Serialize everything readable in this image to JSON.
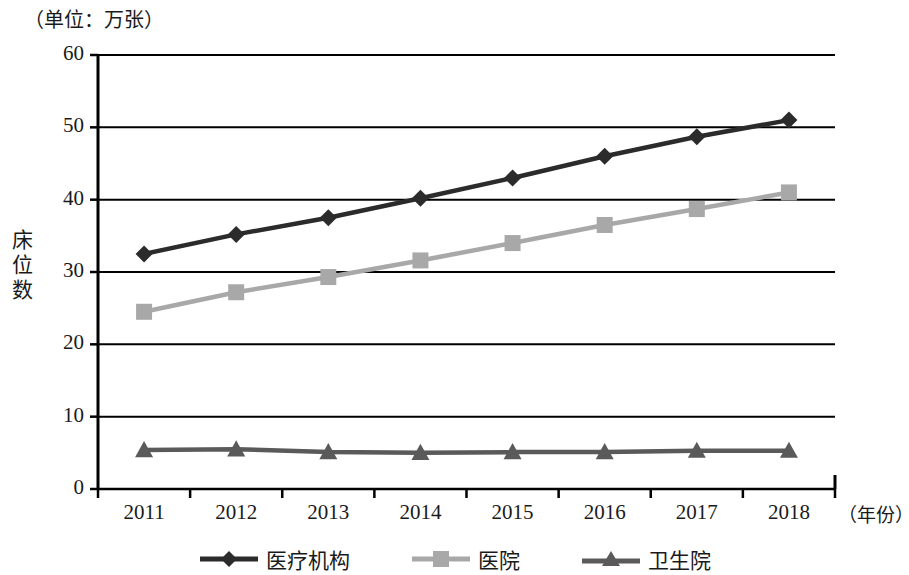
{
  "chart_data": {
    "type": "line",
    "title": "（单位：万张）",
    "unit_note": "（单位：万张）",
    "xlabel": "（年份）",
    "ylabel": "床位数",
    "categories": [
      "2011",
      "2012",
      "2013",
      "2014",
      "2015",
      "2016",
      "2017",
      "2018"
    ],
    "x": [
      2011,
      2012,
      2013,
      2014,
      2015,
      2016,
      2017,
      2018
    ],
    "ylim": [
      0,
      60
    ],
    "yticks": [
      0,
      10,
      20,
      30,
      40,
      50,
      60
    ],
    "ytick_labels": [
      "0",
      "10",
      "20",
      "30",
      "40",
      "50",
      "60"
    ],
    "grid": true,
    "legend_position": "bottom",
    "series": [
      {
        "name": "医疗机构",
        "marker": "diamond",
        "color": "#2b2b2b",
        "values": [
          32.5,
          35.2,
          37.5,
          40.2,
          43.0,
          46.0,
          48.7,
          51.0
        ]
      },
      {
        "name": "医院",
        "marker": "square",
        "color": "#a8a8a8",
        "values": [
          24.5,
          27.2,
          29.3,
          31.6,
          34.0,
          36.5,
          38.7,
          41.0
        ]
      },
      {
        "name": "卫生院",
        "marker": "triangle",
        "color": "#5a5a5a",
        "values": [
          5.4,
          5.5,
          5.1,
          5.0,
          5.1,
          5.1,
          5.3,
          5.3
        ]
      }
    ]
  },
  "colors": {
    "axis": "#000000",
    "grid": "#000000",
    "background": "#ffffff",
    "series_medical_institutions": "#2b2b2b",
    "series_hospitals": "#a8a8a8",
    "series_health_centers": "#5a5a5a"
  },
  "legend": {
    "items": [
      {
        "label": "医疗机构",
        "marker": "diamond",
        "color": "#2b2b2b"
      },
      {
        "label": "医院",
        "marker": "square",
        "color": "#a8a8a8"
      },
      {
        "label": "卫生院",
        "marker": "triangle",
        "color": "#5a5a5a"
      }
    ]
  }
}
